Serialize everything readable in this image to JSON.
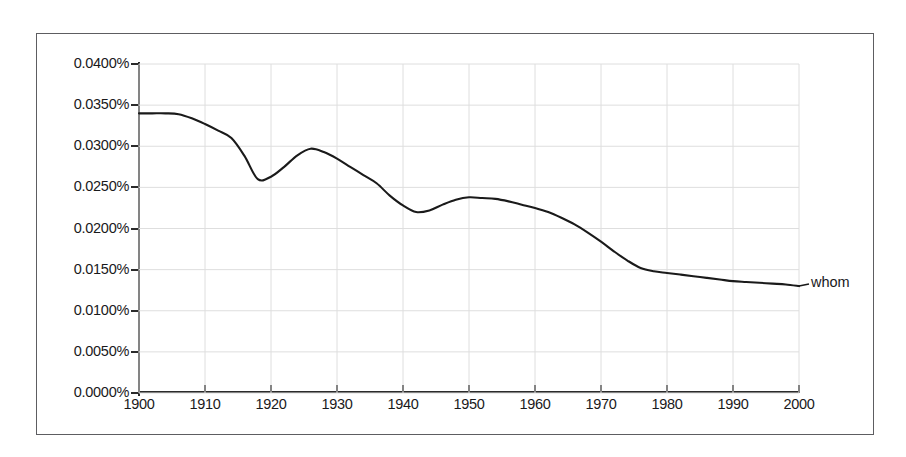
{
  "chart_data": {
    "type": "line",
    "title": "",
    "subtitle": "",
    "xlabel": "",
    "ylabel": "",
    "xlim": [
      1900,
      2000
    ],
    "ylim": [
      0.0,
      0.04
    ],
    "grid": true,
    "legend_position": "right-end-label",
    "x_ticks": [
      "1900",
      "1910",
      "1920",
      "1930",
      "1940",
      "1950",
      "1960",
      "1970",
      "1980",
      "1990",
      "2000"
    ],
    "y_ticks": [
      "0.0000%",
      "0.0050%",
      "0.0100%",
      "0.0150%",
      "0.0200%",
      "0.0250%",
      "0.0300%",
      "0.0350%",
      "0.0400%"
    ],
    "series": [
      {
        "name": "whom",
        "color": "#1a1a1a",
        "end_label": "whom",
        "x": [
          1900,
          1902,
          1904,
          1906,
          1908,
          1910,
          1912,
          1914,
          1916,
          1918,
          1920,
          1922,
          1924,
          1926,
          1928,
          1930,
          1932,
          1934,
          1936,
          1938,
          1940,
          1942,
          1944,
          1946,
          1948,
          1950,
          1952,
          1954,
          1956,
          1958,
          1960,
          1962,
          1964,
          1966,
          1968,
          1970,
          1972,
          1974,
          1976,
          1978,
          1980,
          1982,
          1984,
          1986,
          1988,
          1990,
          1992,
          1994,
          1996,
          1998,
          2000
        ],
        "values": [
          0.034,
          0.034,
          0.034,
          0.0339,
          0.0334,
          0.0327,
          0.0319,
          0.031,
          0.0288,
          0.026,
          0.0263,
          0.0275,
          0.0289,
          0.0297,
          0.0293,
          0.0285,
          0.0275,
          0.0265,
          0.0255,
          0.024,
          0.0228,
          0.022,
          0.0222,
          0.0229,
          0.0235,
          0.0238,
          0.0237,
          0.0236,
          0.0233,
          0.0229,
          0.0225,
          0.022,
          0.0213,
          0.0205,
          0.0195,
          0.0184,
          0.0172,
          0.0161,
          0.0152,
          0.0148,
          0.0146,
          0.0144,
          0.0142,
          0.014,
          0.0138,
          0.0136,
          0.0135,
          0.0134,
          0.0133,
          0.0132,
          0.013
        ]
      }
    ]
  },
  "axes": {
    "y_labels": [
      "0.0400%",
      "0.0350%",
      "0.0300%",
      "0.0250%",
      "0.0200%",
      "0.0150%",
      "0.0100%",
      "0.0050%",
      "0.0000%"
    ],
    "x_labels": [
      "1900",
      "1910",
      "1920",
      "1930",
      "1940",
      "1950",
      "1960",
      "1970",
      "1980",
      "1990",
      "2000"
    ]
  },
  "legend": {
    "series_label": "whom"
  },
  "colors": {
    "line": "#1a1a1a",
    "axis": "#2b2b2b",
    "grid": "#dedede",
    "frame": "#5d5d61",
    "background": "#ffffff",
    "text": "#19191b"
  }
}
